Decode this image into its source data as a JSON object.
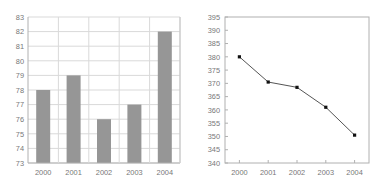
{
  "chart_data": [
    {
      "type": "bar",
      "title": "",
      "xlabel": "",
      "ylabel": "",
      "categories": [
        "2000",
        "2001",
        "2002",
        "2003",
        "2004"
      ],
      "values": [
        78,
        79,
        76,
        77,
        82
      ],
      "ylim": [
        73,
        83
      ],
      "yticks": [
        73,
        74,
        75,
        76,
        77,
        78,
        79,
        80,
        81,
        82,
        83
      ],
      "grid": "horizontal",
      "legend": "none",
      "bar_color": "#969696",
      "grid_color": "#d9d9d9",
      "axis_color": "#b0b0b0",
      "label_color": "#777777"
    },
    {
      "type": "line",
      "title": "",
      "xlabel": "",
      "ylabel": "",
      "categories": [
        "2000",
        "2001",
        "2002",
        "2003",
        "2004"
      ],
      "values": [
        380,
        370.5,
        368.5,
        361,
        350.5
      ],
      "ylim": [
        340,
        395
      ],
      "yticks": [
        340,
        345,
        350,
        355,
        360,
        365,
        370,
        375,
        380,
        385,
        390,
        395
      ],
      "grid": "none",
      "legend": "none",
      "line_color": "#555555",
      "marker_color": "#111111",
      "axis_color": "#b0b0b0",
      "label_color": "#777777"
    }
  ]
}
